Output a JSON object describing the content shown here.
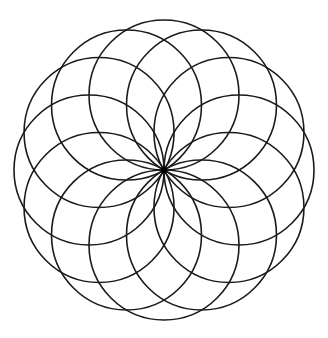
{
  "diagram": {
    "type": "circle-rosette",
    "canvas": {
      "width": 328,
      "height": 338,
      "background": "#ffffff"
    },
    "center": {
      "x": 164,
      "y": 170
    },
    "circle_count": 12,
    "circle_radius": 75,
    "angle_step_deg": 30,
    "start_angle_deg": 0,
    "stroke_color": "#1a1a1a",
    "stroke_width": 1.6,
    "center_dot": {
      "radius": 3.2,
      "color": "#000000"
    }
  }
}
